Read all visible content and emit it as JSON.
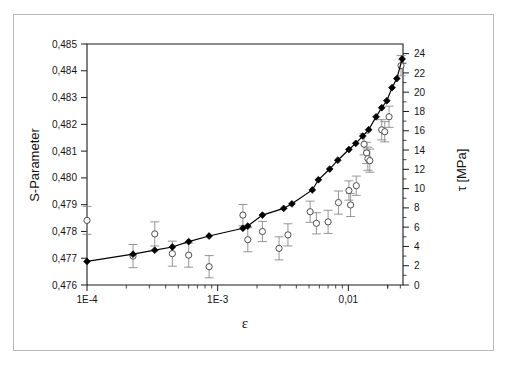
{
  "figure": {
    "background_color": "#ffffff",
    "border_color": "#b9b9b9",
    "axis_color": "#1a1a1a"
  },
  "chart_data": {
    "type": "scatter",
    "title": "",
    "subtitle": "",
    "xlabel": "ε",
    "ylabel": "S-Parameter",
    "y2label": "τ [MPa]",
    "xscale": "log",
    "xlim": [
      0.0001,
      0.0262
    ],
    "ylim": [
      0.476,
      0.485
    ],
    "y2lim": [
      0,
      25.0
    ],
    "grid": false,
    "legend": null,
    "legend_position": "none",
    "xtick_labels": [
      "1E-4",
      "1E-3",
      "0,01"
    ],
    "xtick_values": [
      0.0001,
      0.001,
      0.01
    ],
    "ytick_labels": [
      "0,476",
      "0,477",
      "0,478",
      "0,479",
      "0,480",
      "0,481",
      "0,482",
      "0,483",
      "0,484",
      "0,485"
    ],
    "ytick_values": [
      0.476,
      0.477,
      0.478,
      0.479,
      0.48,
      0.481,
      0.482,
      0.483,
      0.484,
      0.485
    ],
    "y2tick_labels": [
      "0",
      "2",
      "4",
      "6",
      "8",
      "10",
      "12",
      "14",
      "16",
      "18",
      "20",
      "22",
      "24"
    ],
    "y2tick_values": [
      0,
      2,
      4,
      6,
      8,
      10,
      12,
      14,
      16,
      18,
      20,
      22,
      24
    ],
    "series": [
      {
        "name": "S-Parameter",
        "marker": "filled-diamond",
        "marker_color": "#000000",
        "line": true,
        "axis": "left",
        "points": [
          {
            "x": 0.0001,
            "y": 0.47688
          },
          {
            "x": 0.000225,
            "y": 0.47715
          },
          {
            "x": 0.00033,
            "y": 0.4773
          },
          {
            "x": 0.00045,
            "y": 0.47742
          },
          {
            "x": 0.0006,
            "y": 0.47762
          },
          {
            "x": 0.00086,
            "y": 0.47783
          },
          {
            "x": 0.00156,
            "y": 0.47812
          },
          {
            "x": 0.0017,
            "y": 0.4782
          },
          {
            "x": 0.0022,
            "y": 0.47861
          },
          {
            "x": 0.0032,
            "y": 0.47886
          },
          {
            "x": 0.0037,
            "y": 0.47903
          },
          {
            "x": 0.0053,
            "y": 0.47955
          },
          {
            "x": 0.0059,
            "y": 0.47993
          },
          {
            "x": 0.0072,
            "y": 0.48033
          },
          {
            "x": 0.0083,
            "y": 0.48066
          },
          {
            "x": 0.0101,
            "y": 0.48106
          },
          {
            "x": 0.0114,
            "y": 0.48129
          },
          {
            "x": 0.0129,
            "y": 0.48156
          },
          {
            "x": 0.0143,
            "y": 0.4818
          },
          {
            "x": 0.0163,
            "y": 0.48228
          },
          {
            "x": 0.018,
            "y": 0.48262
          },
          {
            "x": 0.0197,
            "y": 0.48288
          },
          {
            "x": 0.0216,
            "y": 0.48337
          },
          {
            "x": 0.0235,
            "y": 0.48371
          },
          {
            "x": 0.0258,
            "y": 0.48444
          }
        ]
      },
      {
        "name": "τ",
        "marker": "open-circle",
        "marker_color": "#4d4d4d",
        "line": false,
        "axis": "right",
        "points": [
          {
            "x": 0.0001,
            "y": 6.7,
            "err": 1.45
          },
          {
            "x": 0.000225,
            "y": 3.0,
            "err": 1.2
          },
          {
            "x": 0.00033,
            "y": 5.3,
            "err": 1.25
          },
          {
            "x": 0.00045,
            "y": 3.25,
            "err": 1.3
          },
          {
            "x": 0.0006,
            "y": 3.1,
            "err": 1.25
          },
          {
            "x": 0.00086,
            "y": 1.9,
            "err": 1.15
          },
          {
            "x": 0.00156,
            "y": 7.25,
            "err": 1.1
          },
          {
            "x": 0.0017,
            "y": 4.7,
            "err": 1.25
          },
          {
            "x": 0.0022,
            "y": 5.55,
            "err": 1.05
          },
          {
            "x": 0.00295,
            "y": 3.8,
            "err": 1.2
          },
          {
            "x": 0.00345,
            "y": 5.2,
            "err": 1.15
          },
          {
            "x": 0.0051,
            "y": 7.6,
            "err": 1.1
          },
          {
            "x": 0.0057,
            "y": 6.4,
            "err": 1.1
          },
          {
            "x": 0.007,
            "y": 6.55,
            "err": 1.2
          },
          {
            "x": 0.0084,
            "y": 8.55,
            "err": 1.2
          },
          {
            "x": 0.0101,
            "y": 9.8,
            "err": 1.0
          },
          {
            "x": 0.0104,
            "y": 8.3,
            "err": 1.2
          },
          {
            "x": 0.0115,
            "y": 10.3,
            "err": 1.0
          },
          {
            "x": 0.0132,
            "y": 14.6,
            "err": 1.1
          },
          {
            "x": 0.0138,
            "y": 13.7,
            "err": 1.1
          },
          {
            "x": 0.0141,
            "y": 13.1,
            "err": 1.2
          },
          {
            "x": 0.0146,
            "y": 12.9,
            "err": 1.2
          },
          {
            "x": 0.018,
            "y": 16.1,
            "err": 1.05
          },
          {
            "x": 0.019,
            "y": 15.9,
            "err": 1.05
          },
          {
            "x": 0.0205,
            "y": 17.45,
            "err": 1.1
          },
          {
            "x": 0.0253,
            "y": 22.75,
            "err": 1.05
          }
        ]
      }
    ]
  }
}
